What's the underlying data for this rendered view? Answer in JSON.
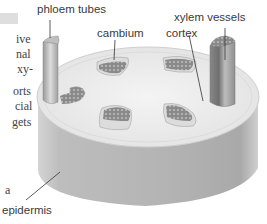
{
  "diagram": {
    "labels": {
      "phloem": "phloem tubes",
      "cambium": "cambium",
      "xylem": "xylem vessels",
      "cortex": "cortex",
      "epidermis": "epidermis"
    },
    "side_text_fragments": [
      "ive",
      "nal",
      "xy-",
      "orts",
      "cial",
      "gets",
      "a"
    ],
    "colors": {
      "epidermis_side": "#b5b5b5",
      "top_surface": "#ececec",
      "bundle_fill": "#8c8c8c",
      "cambium_ring": "#d6d6d6",
      "label_text": "#3a3a3a"
    }
  }
}
